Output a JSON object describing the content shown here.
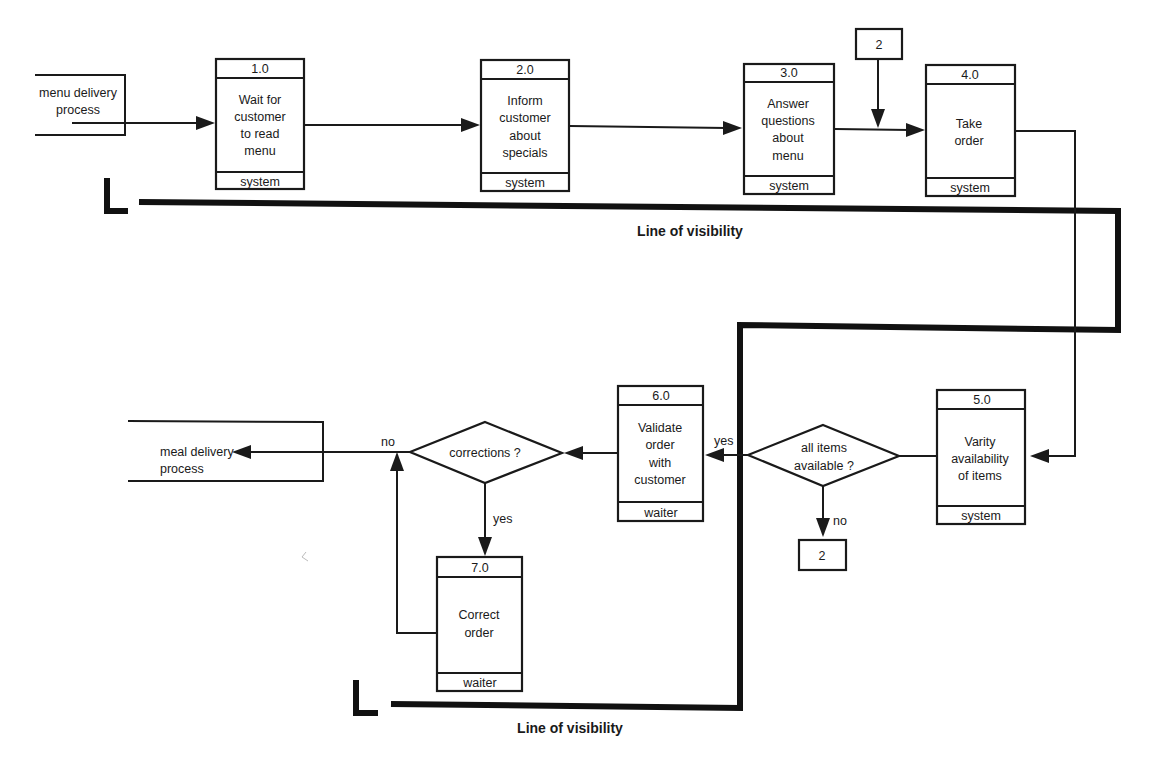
{
  "diagram": {
    "colors": {
      "ink": "#1a1a1a",
      "background": "#ffffff"
    },
    "terminators": [
      {
        "id": "menu-delivery",
        "label_lines": [
          "menu delivery",
          "process"
        ]
      },
      {
        "id": "meal-delivery",
        "label_lines": [
          "meal delivery",
          "process"
        ]
      }
    ],
    "processes": [
      {
        "id": "1.0",
        "number": "1.0",
        "label_lines": [
          "Wait for",
          "customer",
          "to read",
          "menu"
        ],
        "actor": "system"
      },
      {
        "id": "2.0",
        "number": "2.0",
        "label_lines": [
          "Inform",
          "customer",
          "about",
          "specials"
        ],
        "actor": "system"
      },
      {
        "id": "3.0",
        "number": "3.0",
        "label_lines": [
          "Answer",
          "questions",
          "about",
          "menu"
        ],
        "actor": "system"
      },
      {
        "id": "4.0",
        "number": "4.0",
        "label_lines": [
          "Take",
          "order"
        ],
        "actor": "system"
      },
      {
        "id": "5.0",
        "number": "5.0",
        "label_lines": [
          "Varity",
          "availability",
          "of items"
        ],
        "actor": "system"
      },
      {
        "id": "6.0",
        "number": "6.0",
        "label_lines": [
          "Validate",
          "order",
          "with",
          "customer"
        ],
        "actor": "waiter"
      },
      {
        "id": "7.0",
        "number": "7.0",
        "label_lines": [
          "Correct",
          "order"
        ],
        "actor": "waiter"
      }
    ],
    "decisions": [
      {
        "id": "all-items",
        "label_lines": [
          "all items",
          "available ?"
        ],
        "yes_label": "yes",
        "no_label": "no"
      },
      {
        "id": "corrections",
        "label_lines": [
          "corrections ?"
        ],
        "yes_label": "yes",
        "no_label": "no"
      }
    ],
    "connectors": [
      {
        "id": "connector-top",
        "label": "2"
      },
      {
        "id": "connector-bottom",
        "label": "2"
      }
    ],
    "visibility_lines": [
      {
        "label": "Line of visibility"
      },
      {
        "label": "Line of visibility"
      }
    ]
  }
}
